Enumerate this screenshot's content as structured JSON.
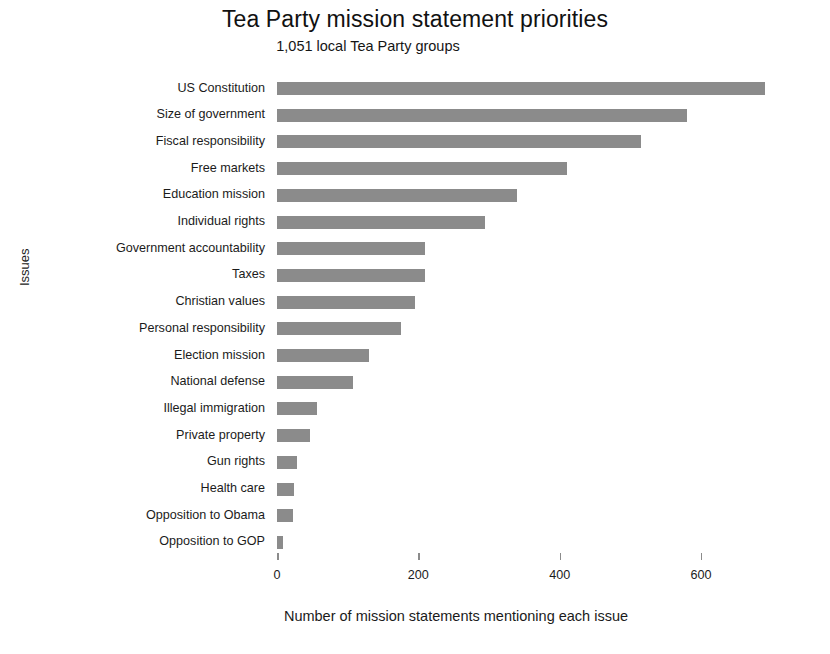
{
  "chart_data": {
    "type": "bar",
    "orientation": "horizontal",
    "title": "Tea Party mission statement priorities",
    "subtitle": "1,051 local Tea Party groups",
    "xlabel": "Number of mission statements mentioning each issue",
    "ylabel": "Issues",
    "xlim": [
      0,
      700
    ],
    "xticks": [
      0,
      200,
      400,
      600
    ],
    "xtick_labels": [
      "0",
      "200",
      "400",
      "600"
    ],
    "grid": false,
    "legend": false,
    "bar_color": "#8b8b8b",
    "background_color": "#ffffff",
    "categories": [
      "US Constitution",
      "Size of government",
      "Fiscal responsibility",
      "Free markets",
      "Education mission",
      "Individual rights",
      "Government accountability",
      "Taxes",
      "Christian values",
      "Personal responsibility",
      "Election mission",
      "National defense",
      "Illegal immigration",
      "Private property",
      "Gun rights",
      "Health care",
      "Opposition to Obama",
      "Opposition to GOP"
    ],
    "values": [
      690,
      580,
      515,
      410,
      340,
      295,
      210,
      210,
      195,
      175,
      130,
      108,
      57,
      46,
      28,
      24,
      22,
      9
    ]
  }
}
